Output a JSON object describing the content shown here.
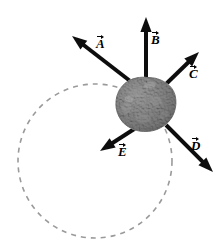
{
  "figure": {
    "canvas": {
      "width": 219,
      "height": 249,
      "background": "#ffffff"
    },
    "body": {
      "name": "asteroid",
      "shape": "irregular-sphere",
      "center": {
        "x": 147,
        "y": 105.5
      },
      "radius": 28,
      "fill": "#a8a8a8",
      "shade_light": "#bdbdbd",
      "shade_dark": "#8e8e8e",
      "outline": "#7d7d7d"
    },
    "orbit": {
      "name": "dashed-orbit-circle",
      "center": {
        "x": 95,
        "y": 161
      },
      "radius": 77,
      "stroke": "#9a9a9a",
      "stroke_width": 1.6,
      "dash": "5 5",
      "style": "dashed"
    },
    "vectors": [
      {
        "id": "A",
        "label": "A",
        "tail": {
          "x": 134,
          "y": 84
        },
        "tip": {
          "x": 72,
          "y": 36
        },
        "label_pos": {
          "x": 96,
          "y": 34
        },
        "color": "#111111",
        "width": 4
      },
      {
        "id": "B",
        "label": "B",
        "tail": {
          "x": 146,
          "y": 82
        },
        "tip": {
          "x": 146,
          "y": 17
        },
        "label_pos": {
          "x": 151,
          "y": 30
        },
        "color": "#111111",
        "width": 4
      },
      {
        "id": "C",
        "label": "C",
        "tail": {
          "x": 164,
          "y": 86
        },
        "tip": {
          "x": 199,
          "y": 52
        },
        "label_pos": {
          "x": 189,
          "y": 64
        },
        "color": "#111111",
        "width": 4
      },
      {
        "id": "D",
        "label": "D",
        "tail": {
          "x": 166,
          "y": 125
        },
        "tip": {
          "x": 213,
          "y": 172
        },
        "label_pos": {
          "x": 191,
          "y": 136
        },
        "color": "#111111",
        "width": 4
      },
      {
        "id": "E",
        "label": "E",
        "tail": {
          "x": 142,
          "y": 124
        },
        "tip": {
          "x": 100,
          "y": 151
        },
        "label_pos": {
          "x": 118,
          "y": 142
        },
        "color": "#111111",
        "width": 4
      }
    ]
  }
}
